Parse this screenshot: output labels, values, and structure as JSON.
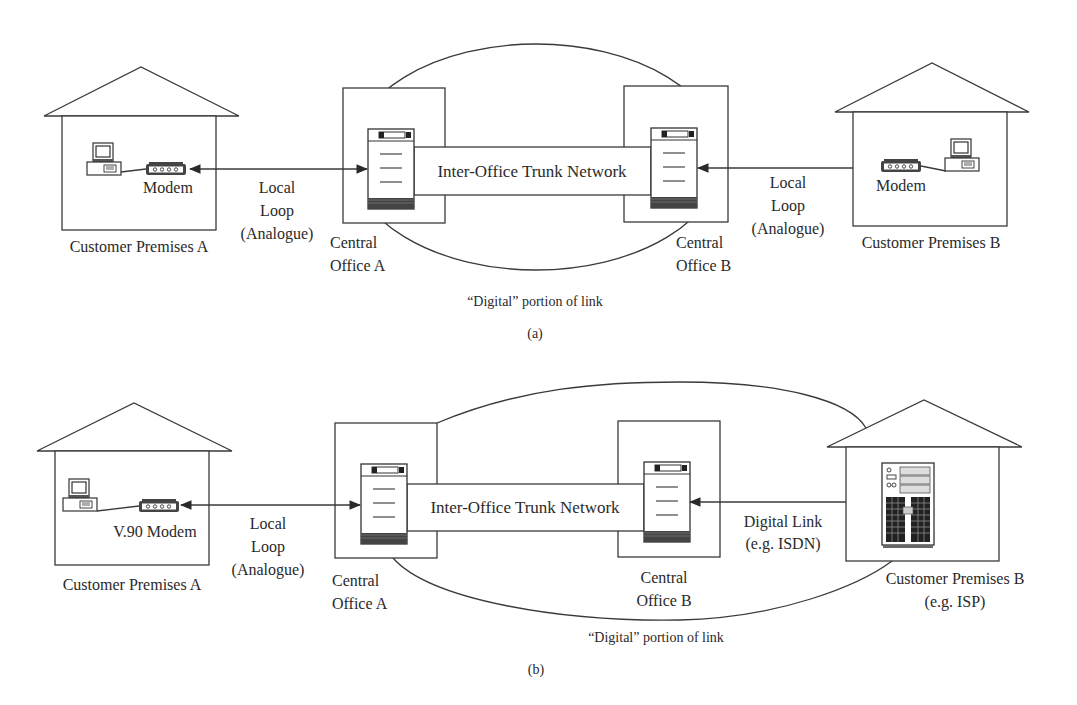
{
  "panel_a": {
    "caption": "(a)",
    "customer_a": {
      "label": "Customer Premises A",
      "device_label": "Modem"
    },
    "link_a": {
      "line1": "Local",
      "line2": "Loop",
      "line3": "(Analogue)"
    },
    "central_office_a": {
      "line1": "Central",
      "line2": "Office A"
    },
    "trunk": {
      "label": "Inter-Office Trunk Network"
    },
    "central_office_b": {
      "line1": "Central",
      "line2": "Office B"
    },
    "link_b": {
      "line1": "Local",
      "line2": "Loop",
      "line3": "(Analogue)"
    },
    "customer_b": {
      "label": "Customer Premises B",
      "device_label": "Modem"
    },
    "digital_portion": "“Digital” portion of link"
  },
  "panel_b": {
    "caption": "(b)",
    "customer_a": {
      "label": "Customer Premises A",
      "device_label": "V.90 Modem"
    },
    "link_a": {
      "line1": "Local",
      "line2": "Loop",
      "line3": "(Analogue)"
    },
    "central_office_a": {
      "line1": "Central",
      "line2": "Office A"
    },
    "trunk": {
      "label": "Inter-Office Trunk Network"
    },
    "central_office_b": {
      "line1": "Central",
      "line2": "Office B"
    },
    "link_b": {
      "line1": "Digital Link",
      "line2": "(e.g. ISDN)"
    },
    "customer_b": {
      "line1": "Customer Premises B",
      "line2": "(e.g. ISP)"
    },
    "digital_portion": "“Digital” portion of link"
  },
  "icons": [
    "house-icon",
    "computer-icon",
    "modem-icon",
    "switch-icon",
    "server-icon",
    "arrow-icon"
  ],
  "colors": {
    "line": "#3a3a3a",
    "text": "#2a2a2a",
    "background": "#ffffff"
  }
}
